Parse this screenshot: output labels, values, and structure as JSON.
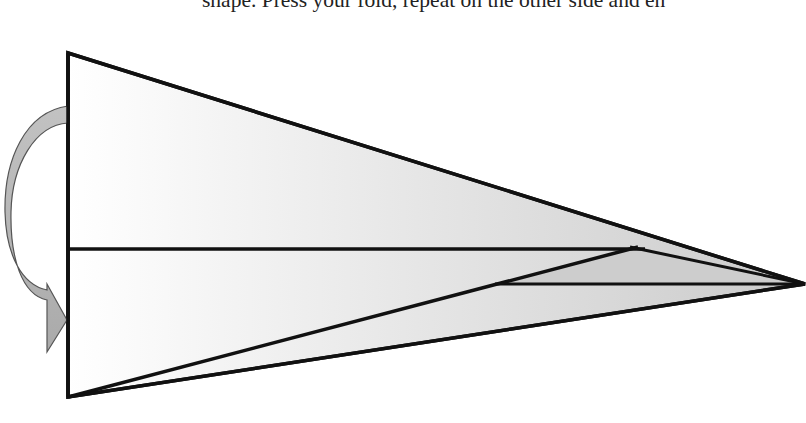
{
  "caption": {
    "text": "shape. Press your fold, repeat on the other side and en"
  },
  "diagram": {
    "colors": {
      "stroke": "#111111",
      "fill_light": "#ffffff",
      "fill_dark": "#cfcfcf",
      "arrow_fill": "#b8b8b8",
      "arrow_stroke": "#555555"
    },
    "shapes": {
      "outer_triangle": "68,53 805,284 68,397",
      "center_fold_line": "68,249 645,249",
      "upper_flap_edge": "632,247 805,284",
      "lower_diagonal": "68,397 638,247",
      "bottom_crease": "495,284 805,284"
    },
    "arrow": {
      "label": "fold-over-arrow",
      "direction": "fold upper half down"
    }
  }
}
